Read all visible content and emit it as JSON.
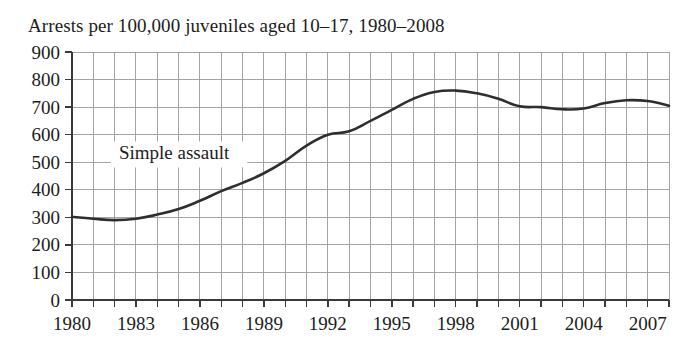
{
  "chart_data": {
    "type": "line",
    "title": "Arrests per 100,000 juveniles aged 10–17, 1980–2008",
    "xlabel": "",
    "ylabel": "",
    "xlim": [
      1980,
      2008
    ],
    "ylim": [
      0,
      900
    ],
    "grid": true,
    "legend_position": "inline-annotation",
    "y_ticks": [
      0,
      100,
      200,
      300,
      400,
      500,
      600,
      700,
      800,
      900
    ],
    "y_tick_labels": [
      "0",
      "100",
      "200",
      "300",
      "400",
      "500",
      "600",
      "700",
      "800",
      "900"
    ],
    "x_ticks": [
      1980,
      1981,
      1982,
      1983,
      1984,
      1985,
      1986,
      1987,
      1988,
      1989,
      1990,
      1991,
      1992,
      1993,
      1994,
      1995,
      1996,
      1997,
      1998,
      1999,
      2000,
      2001,
      2002,
      2003,
      2004,
      2005,
      2006,
      2007,
      2008
    ],
    "x_tick_labels_shown": [
      "1980",
      "1983",
      "1986",
      "1989",
      "1992",
      "1995",
      "1998",
      "2001",
      "2004",
      "2007"
    ],
    "x_label_interval": 3,
    "series": [
      {
        "name": "Simple assault",
        "annotation": "Simple assault",
        "color": "#2e2e2e",
        "x": [
          1980,
          1981,
          1982,
          1983,
          1984,
          1985,
          1986,
          1987,
          1988,
          1989,
          1990,
          1991,
          1992,
          1993,
          1994,
          1995,
          1996,
          1997,
          1998,
          1999,
          2000,
          2001,
          2002,
          2003,
          2004,
          2005,
          2006,
          2007,
          2008
        ],
        "values": [
          302,
          295,
          290,
          295,
          310,
          330,
          360,
          395,
          425,
          460,
          505,
          560,
          600,
          612,
          650,
          690,
          730,
          755,
          760,
          750,
          730,
          703,
          700,
          692,
          695,
          715,
          725,
          722,
          705
        ]
      }
    ],
    "annotations": [
      {
        "text": "Simple assault",
        "x": 1982.2,
        "y": 510
      }
    ],
    "colors": {
      "line": "#2e2e2e",
      "grid": "#9a9a9a",
      "axis": "#3a3a3a",
      "text": "#1c1c1c",
      "background": "#ffffff"
    }
  }
}
